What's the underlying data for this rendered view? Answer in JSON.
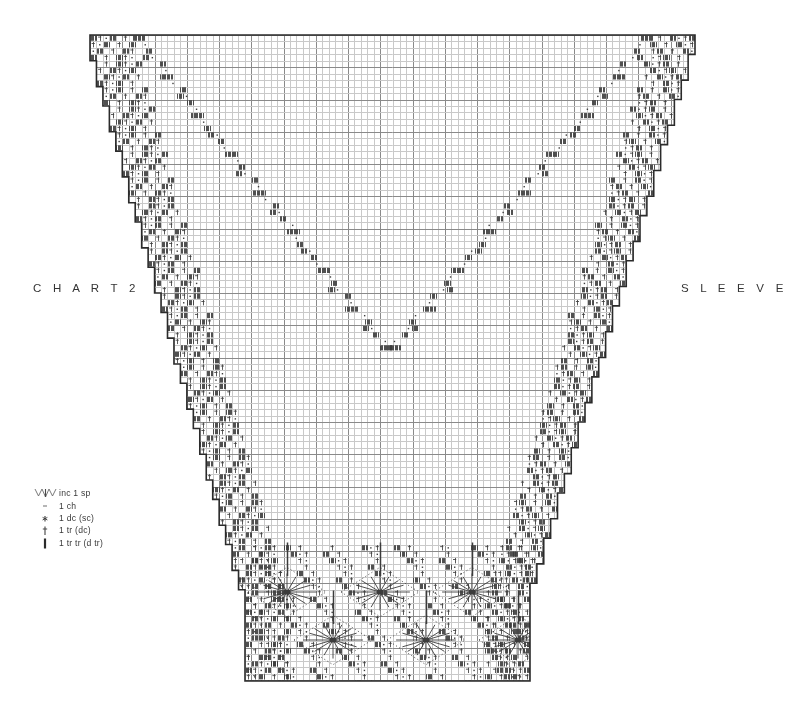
{
  "page": {
    "background": "#ffffff",
    "width": 786,
    "height": 714
  },
  "labels": {
    "chart_label": "C H A R T  2",
    "sleeve_label": "S L E E V E"
  },
  "legend": {
    "title": "",
    "items": [
      {
        "symbol": "inc-fan-icon",
        "label": "inc 1 sp"
      },
      {
        "symbol": "chain-dot-icon",
        "label": "1 ch"
      },
      {
        "symbol": "double-cross-icon",
        "label": "1 dc (sc)"
      },
      {
        "symbol": "treble-icon",
        "label": "1 tr (dc)"
      },
      {
        "symbol": "double-treble-icon",
        "label": "1 tr tr (d tr)"
      }
    ]
  },
  "colors": {
    "grid_light": "#c9c9c9",
    "grid_major": "#8a8a8a",
    "outline": "#2b2b2b",
    "fill_stitch": "#3c3c3c",
    "text": "#343434"
  },
  "chart_data": {
    "type": "table",
    "grid": {
      "cell_size": 6.45,
      "major_every": 5,
      "columns": 94,
      "rows": 101
    },
    "outline": {
      "top_y": 35,
      "bottom_y": 681,
      "top_left_x": 90,
      "top_right_x": 695,
      "bottom_left_x": 245,
      "bottom_right_x": 530,
      "step_count_left": 24,
      "step_count_right": 24
    },
    "motifs": {
      "bottom_flower_count": 6,
      "bottom_flower_rows": 2,
      "flower_row1_y": [
        592,
        640
      ],
      "flower_centers_row1_x": [
        287,
        380,
        472
      ],
      "flower_centers_row2_x": [
        333,
        426,
        518
      ]
    },
    "xlabel": "",
    "ylabel": "",
    "legend_position": "bottom-left"
  }
}
